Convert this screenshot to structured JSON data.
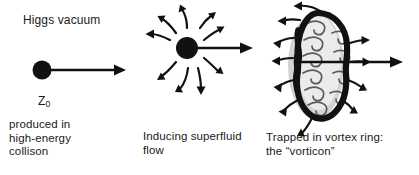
{
  "figure": {
    "width": 419,
    "height": 175,
    "background_color": "#ffffff",
    "ink_color": "#111111",
    "halo_color": "#b8b8b8",
    "text_color": "#1a1a1a"
  },
  "panels": [
    {
      "id": "panel-higgs-vacuum",
      "title": "Higgs vacuum",
      "particle_label_main": "Z",
      "particle_label_sub": "0",
      "caption": "produced in\nhigh-energy\ncollison",
      "icons": {
        "particle": "filled-circle-icon",
        "motion_arrow": "right-arrow-icon"
      }
    },
    {
      "id": "panel-superfluid-flow",
      "title": "",
      "caption": "Inducing superfluid\nflow",
      "icons": {
        "particle": "filled-circle-icon",
        "motion_arrow": "right-arrow-icon",
        "flow_arrows": "curved-outflow-arrows-icon"
      },
      "flow_arrow_count": 8
    },
    {
      "id": "panel-vortex-ring",
      "title": "",
      "caption": "Trapped in vortex ring:\nthe “vorticon”",
      "icons": {
        "ring": "vortex-ring-icon",
        "motion_arrow": "right-arrow-icon",
        "circulation_arrows": "curved-circulation-arrows-icon"
      },
      "outward_arrow_count": 10,
      "inner_curl_count": 9
    }
  ]
}
